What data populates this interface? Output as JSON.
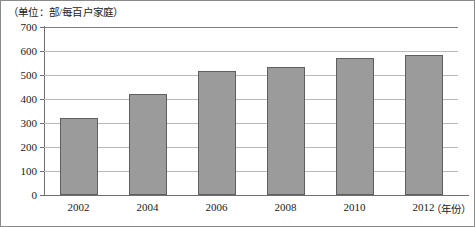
{
  "caption": "（单位：部/每百户家庭）",
  "chart_data": {
    "type": "bar",
    "title": "",
    "subtitle": "",
    "caption": "（单位：部/每百户家庭）",
    "xlabel": "（年份）",
    "ylabel": "",
    "categories": [
      "2002",
      "2004",
      "2006",
      "2008",
      "2010",
      "2012"
    ],
    "values": [
      320,
      420,
      515,
      535,
      570,
      585
    ],
    "series": [
      {
        "name": "每百户家庭移动电话拥有量",
        "values": [
          320,
          420,
          515,
          535,
          570,
          585
        ]
      }
    ],
    "ylim": [
      0,
      700
    ],
    "yticks": [
      0,
      100,
      200,
      300,
      400,
      500,
      600,
      700
    ],
    "ytick_labels": [
      "0",
      "100",
      "200",
      "300",
      "400",
      "500",
      "600",
      "700"
    ],
    "grid": true,
    "grid_axis": "y",
    "legend": false,
    "legend_position": "none",
    "bar_color": "#9b9b9b",
    "bar_edge_color": "#5f5f5f",
    "grid_color": "#b9b9b9",
    "axis_color": "#6f6f6f"
  },
  "axis": {
    "y_labels": [
      "700",
      "600",
      "500",
      "400",
      "300",
      "200",
      "100",
      "0"
    ],
    "x_labels": [
      "2002",
      "2004",
      "2006",
      "2008",
      "2010",
      "2012"
    ],
    "x_title": "（年份）"
  }
}
